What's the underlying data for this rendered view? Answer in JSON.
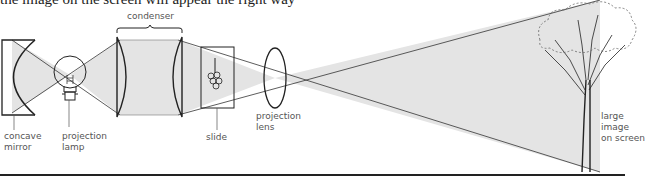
{
  "heading": "the image on the screen will appear the right way",
  "labels": {
    "condenser": "condenser",
    "concave_mirror_1": "concave",
    "concave_mirror_2": "mirror",
    "projection_lamp_1": "projection",
    "projection_lamp_2": "lamp",
    "slide": "slide",
    "projection_lens_1": "projection",
    "projection_lens_2": "lens",
    "large_image_1": "large",
    "large_image_2": "image",
    "large_image_3": "on screen"
  },
  "colors": {
    "light_beam": "#e4e4e4",
    "line": "#222222",
    "label": "#555555"
  }
}
